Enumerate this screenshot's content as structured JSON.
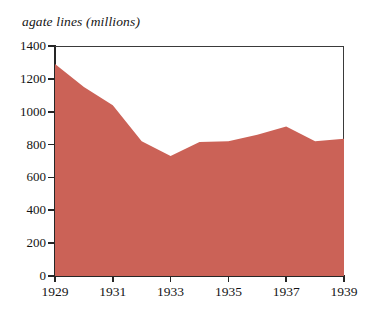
{
  "chart_data": {
    "type": "area",
    "title": "agate lines (millions)",
    "xlabel": "",
    "ylabel": "agate lines (millions)",
    "x": [
      1929,
      1930,
      1931,
      1932,
      1933,
      1934,
      1935,
      1936,
      1937,
      1938,
      1939
    ],
    "values": [
      1290,
      1150,
      1040,
      820,
      730,
      815,
      820,
      860,
      910,
      820,
      835
    ],
    "series": [
      {
        "name": "agate lines",
        "values": [
          1290,
          1150,
          1040,
          820,
          730,
          815,
          820,
          860,
          910,
          820,
          835
        ]
      }
    ],
    "xlim": [
      1929,
      1939
    ],
    "ylim": [
      0,
      1400
    ],
    "ytick_labels": [
      "0",
      "200",
      "400",
      "600",
      "800",
      "1000",
      "1200",
      "1400"
    ],
    "ytick_values": [
      0,
      200,
      400,
      600,
      800,
      1000,
      1200,
      1400
    ],
    "xtick_labels": [
      "1929",
      "1931",
      "1933",
      "1935",
      "1937",
      "1939"
    ],
    "xtick_values": [
      1929,
      1931,
      1933,
      1935,
      1937,
      1939
    ],
    "grid": false,
    "legend": null,
    "fill_color": "#cb6257",
    "axis_color": "#262626",
    "background_color": "#ffffff"
  }
}
